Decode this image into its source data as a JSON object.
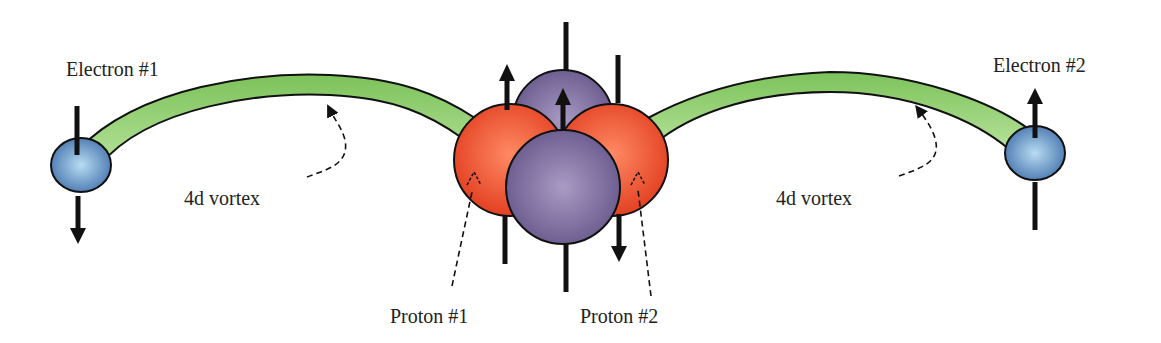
{
  "diagram": {
    "labels": {
      "electron1": "Electron #1",
      "electron2": "Electron #2",
      "vortex_left": "4d vortex",
      "vortex_right": "4d vortex",
      "proton1": "Proton #1",
      "proton2": "Proton #2"
    },
    "colors": {
      "vortex_fill": "#8ccf6a",
      "electron_fill": "#5f8fc8",
      "proton_fill": "#f05a3a",
      "neutron_fill": "#7a6a9a",
      "stroke": "#111111"
    },
    "components": [
      {
        "id": "electron-1",
        "type": "electron",
        "spin": "down"
      },
      {
        "id": "electron-2",
        "type": "electron",
        "spin": "up"
      },
      {
        "id": "proton-1",
        "type": "proton",
        "spin": "up"
      },
      {
        "id": "proton-2",
        "type": "proton",
        "spin": "down"
      },
      {
        "id": "neutron-back",
        "type": "neutron",
        "spin": "up"
      },
      {
        "id": "neutron-front",
        "type": "neutron",
        "spin": "up"
      }
    ]
  }
}
